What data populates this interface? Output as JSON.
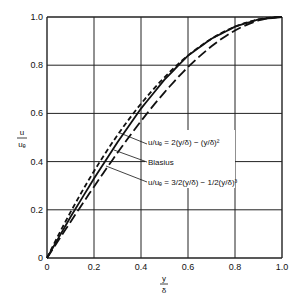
{
  "chart_data": {
    "type": "line",
    "title": "",
    "xlabel": "y/δ",
    "ylabel": "u/u_e",
    "xlim": [
      0,
      1.0
    ],
    "ylim": [
      0,
      1.0
    ],
    "grid": true,
    "x_ticks": [
      "0",
      "0.2",
      "0.4",
      "0.6",
      "0.8",
      "1.0"
    ],
    "y_ticks": [
      "0",
      "0.2",
      "0.4",
      "0.6",
      "0.8",
      "1.0"
    ],
    "series": [
      {
        "name": "u/u_e = 2(y/δ) − (y/δ)^2",
        "style": "short-dash",
        "x": [
          0,
          0.1,
          0.2,
          0.3,
          0.4,
          0.5,
          0.6,
          0.7,
          0.8,
          0.9,
          1.0
        ],
        "y": [
          0,
          0.19,
          0.36,
          0.51,
          0.64,
          0.75,
          0.84,
          0.91,
          0.96,
          0.99,
          1.0
        ]
      },
      {
        "name": "Blasius",
        "style": "solid",
        "x": [
          0,
          0.1,
          0.2,
          0.3,
          0.4,
          0.5,
          0.6,
          0.7,
          0.8,
          0.9,
          1.0
        ],
        "y": [
          0,
          0.17,
          0.33,
          0.48,
          0.62,
          0.74,
          0.84,
          0.91,
          0.96,
          0.99,
          1.0
        ]
      },
      {
        "name": "u/u_e = 3/2(y/δ) − 1/2(y/δ)^3",
        "style": "long-dash",
        "x": [
          0,
          0.1,
          0.2,
          0.3,
          0.4,
          0.5,
          0.6,
          0.7,
          0.8,
          0.9,
          1.0
        ],
        "y": [
          0,
          0.15,
          0.3,
          0.44,
          0.57,
          0.69,
          0.79,
          0.88,
          0.94,
          0.99,
          1.0
        ]
      }
    ],
    "annotations": [
      "u/u_e = 2(y/δ) − (y/δ)²",
      "Blasius",
      "u/u_e = 3/2(y/δ) − 1/2(y/δ)³"
    ]
  },
  "labels": {
    "ylabel_num": "u",
    "ylabel_den": "uₑ",
    "xlabel_num": "y",
    "xlabel_den": "δ",
    "ann_parabolic": "u/uₑ = 2(y/δ) − (y/δ)²",
    "ann_blasius": "Blasius",
    "ann_cubic": "u/uₑ = 3/2(y/δ) − 1/2(y/δ)³"
  }
}
